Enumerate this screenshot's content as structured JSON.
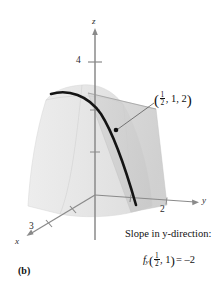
{
  "figure": {
    "caption": "(b)",
    "axes": {
      "x_label": "x",
      "y_label": "y",
      "z_label": "z",
      "x_tick_label": "3",
      "y_tick_label": "2",
      "z_tick_label": "4"
    },
    "point_label": {
      "open_paren": "(",
      "frac_num": "1",
      "frac_den": "2",
      "rest": ", 1, 2",
      "close_paren": ")"
    },
    "annotation": {
      "title": "Slope in y-direction:",
      "function_name": "f",
      "subscript": "y",
      "open_paren": "(",
      "frac_num": "1",
      "frac_den": "2",
      "arg_rest": ", 1",
      "close_paren": ")",
      "equals": "= –2"
    },
    "colors": {
      "surface_fill": "#e3e3e3",
      "plane_fill": "#cfcfcf",
      "curve": "#141414",
      "axis": "#8a8a8a",
      "text": "#111111"
    }
  }
}
